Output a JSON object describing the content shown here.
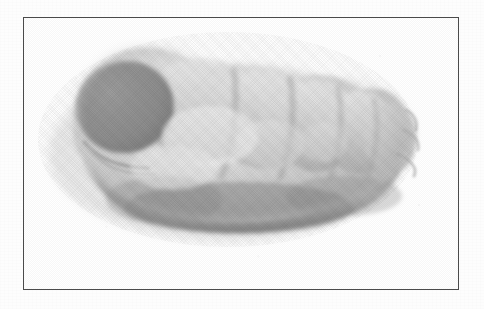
{
  "plate": {
    "background_color": "#ffffff",
    "frame": {
      "border_color": "#4a4a4a",
      "fill_color": "#fcfcfc",
      "x": 23,
      "y": 17,
      "width": 436,
      "height": 273
    },
    "caption": "",
    "label": ""
  },
  "figure": {
    "name": "segmented-larva-specimen",
    "orientation": "head-upper-left",
    "bounding_box": {
      "x": 45,
      "y": 40,
      "width": 355,
      "height": 198
    },
    "tones": {
      "paper": "#fdfdfd",
      "highlight": "#f2f2f2",
      "light_mid": "#d8d8d8",
      "mid": "#b8b8b8",
      "shade": "#9a9a9a",
      "dark": "#808080",
      "darkest": "#6f6f6f"
    },
    "parts": [
      {
        "name": "head-capsule",
        "tone": "#8e8e8e",
        "note": "dark rounded lobe at upper left"
      },
      {
        "name": "neck-fold",
        "tone": "#bfbfbf",
        "note": "crease beneath the head"
      },
      {
        "name": "thoracic-segment-1",
        "tone": "#cfcfcf"
      },
      {
        "name": "thoracic-segment-2",
        "tone": "#c9c9c9"
      },
      {
        "name": "abdominal-segment-1",
        "tone": "#c2c2c2"
      },
      {
        "name": "abdominal-segment-2",
        "tone": "#bdbdbd"
      },
      {
        "name": "abdominal-segment-3",
        "tone": "#bababa"
      },
      {
        "name": "terminal-segment",
        "tone": "#b4b4b4",
        "note": "rounded tail tip at right"
      },
      {
        "name": "ventral-shadow",
        "tone": "#8a8a8a",
        "note": "dark shading along lower contour"
      }
    ]
  }
}
